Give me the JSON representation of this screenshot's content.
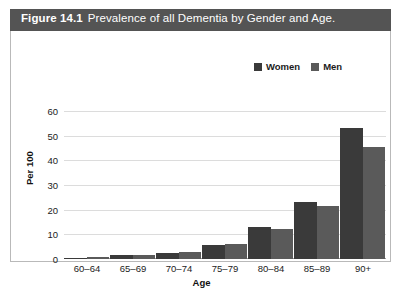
{
  "figure": {
    "number": "Figure 14.1",
    "caption": "Prevalence of all Dementia by Gender and Age."
  },
  "colors": {
    "women": "#3a3a3a",
    "men": "#5a5a5a",
    "title_bar": "#545454",
    "gridline": "#dcdcdc",
    "axis": "#9a9a9a",
    "text": "#1b1b1b"
  },
  "chart_data": {
    "type": "bar",
    "title": "Prevalence of all Dementia by Gender and Age.",
    "xlabel": "Age",
    "ylabel": "Per 100",
    "categories": [
      "60–64",
      "65–69",
      "70–74",
      "75–79",
      "80–84",
      "85–89",
      "90+"
    ],
    "series": [
      {
        "name": "Women",
        "values": [
          0.6,
          1.6,
          2.6,
          5.6,
          12.8,
          23.3,
          53.0
        ]
      },
      {
        "name": "Men",
        "values": [
          0.8,
          1.8,
          3.0,
          6.2,
          12.3,
          21.6,
          45.5
        ]
      }
    ],
    "ylim": [
      0,
      60
    ],
    "yticks": [
      0,
      10,
      20,
      30,
      40,
      50,
      60
    ],
    "grid": true,
    "legend_position": "top-right"
  }
}
